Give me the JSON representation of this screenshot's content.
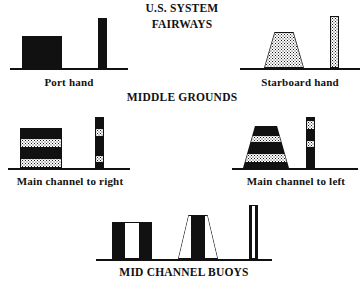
{
  "diagram": {
    "title_line1": "U.S. SYSTEM",
    "title_line2": "FAIRWAYS",
    "section_middle_grounds": "MIDDLE GROUNDS",
    "section_mid_channel": "MID CHANNEL BUOYS",
    "colors": {
      "ink": "#111111",
      "paper": "#ffffff"
    }
  },
  "fairways": {
    "port": {
      "caption": "Port hand",
      "can_buoy": {
        "shape": "can",
        "fill": "solid-black"
      },
      "spar_buoy": {
        "shape": "spar",
        "fill": "solid-black"
      }
    },
    "starboard": {
      "caption": "Starboard hand",
      "nun_buoy": {
        "shape": "nun",
        "fill": "stippled"
      },
      "spar_buoy": {
        "shape": "spar",
        "fill": "stippled"
      }
    }
  },
  "middle_grounds": {
    "heading": "MIDDLE GROUNDS",
    "left": {
      "caption": "Main channel to right",
      "can_buoy": {
        "shape": "can",
        "bands": [
          "black",
          "dotted",
          "black",
          "dotted"
        ]
      },
      "spar_buoy": {
        "shape": "spar",
        "bands": [
          "black",
          "dotted",
          "black",
          "dotted",
          "black"
        ]
      }
    },
    "right": {
      "caption": "Main channel to left",
      "nun_buoy": {
        "shape": "nun",
        "bands": [
          "black",
          "dotted",
          "black",
          "dotted",
          "black"
        ]
      },
      "spar_buoy": {
        "shape": "spar",
        "bands": [
          "black",
          "dotted",
          "black",
          "dotted",
          "black"
        ]
      }
    }
  },
  "mid_channel": {
    "heading": "MID CHANNEL BUOYS",
    "can_buoy": {
      "shape": "can",
      "stripes": [
        "black",
        "white",
        "black"
      ]
    },
    "nun_buoy": {
      "shape": "nun",
      "stripes": [
        "white",
        "black",
        "white"
      ]
    },
    "spar_buoy": {
      "shape": "spar",
      "stripes": [
        "black",
        "white",
        "black"
      ]
    }
  }
}
